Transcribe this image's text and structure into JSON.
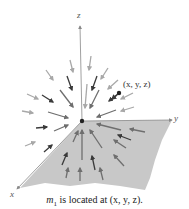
{
  "diagram": {
    "type": "vector-field",
    "axes": {
      "x_label": "x",
      "y_label": "y",
      "z_label": "z"
    },
    "point": {
      "label": "(x, y, z)"
    },
    "caption": {
      "prefix": "m",
      "subscript": "1",
      "text": " is located at (x, y, z)."
    },
    "colors": {
      "plane": "#c8c8c8",
      "axis": "#888888",
      "arrow_dark": "#3a3a3a",
      "arrow_mid": "#6e6e6e",
      "arrow_light": "#a8a8a8"
    }
  }
}
